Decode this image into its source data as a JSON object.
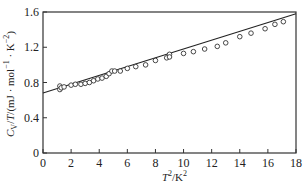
{
  "chart_data": {
    "type": "scatter",
    "title": "",
    "xlabel": "T^2/K^2",
    "ylabel": "C_V/T/(mJ·mol^-1·K^-2)",
    "xlim": [
      0,
      18
    ],
    "ylim": [
      0,
      1.6
    ],
    "x_ticks": [
      0,
      2,
      4,
      6,
      8,
      10,
      12,
      14,
      16,
      18
    ],
    "y_ticks": [
      0,
      0.4,
      0.8,
      1.2,
      1.6
    ],
    "x_tick_labels": [
      "0",
      "2",
      "4",
      "6",
      "8",
      "10",
      "12",
      "14",
      "16",
      "18"
    ],
    "y_tick_labels": [
      "0",
      "0.4",
      "0.8",
      "1.2",
      "1.6"
    ],
    "grid": false,
    "legend": null,
    "series": [
      {
        "name": "measured",
        "marker": "open-circle",
        "x": [
          1.2,
          1.2,
          1.3,
          1.5,
          2.0,
          2.3,
          2.7,
          3.0,
          3.3,
          3.6,
          3.9,
          4.2,
          4.5,
          4.7,
          4.9,
          5.1,
          5.5,
          6.0,
          6.6,
          7.3,
          8.0,
          8.8,
          9.0,
          9.0,
          10.0,
          10.7,
          11.5,
          12.4,
          13.0,
          14.0,
          14.8,
          15.8,
          16.5,
          17.1
        ],
        "y": [
          0.76,
          0.72,
          0.74,
          0.75,
          0.77,
          0.78,
          0.78,
          0.79,
          0.8,
          0.82,
          0.84,
          0.85,
          0.87,
          0.9,
          0.93,
          0.93,
          0.93,
          0.96,
          0.98,
          1.0,
          1.05,
          1.08,
          1.12,
          1.09,
          1.13,
          1.15,
          1.18,
          1.21,
          1.25,
          1.32,
          1.36,
          1.41,
          1.46,
          1.49
        ]
      },
      {
        "name": "linear fit",
        "type": "line",
        "x": [
          0,
          18
        ],
        "y": [
          0.68,
          1.58
        ]
      }
    ]
  }
}
